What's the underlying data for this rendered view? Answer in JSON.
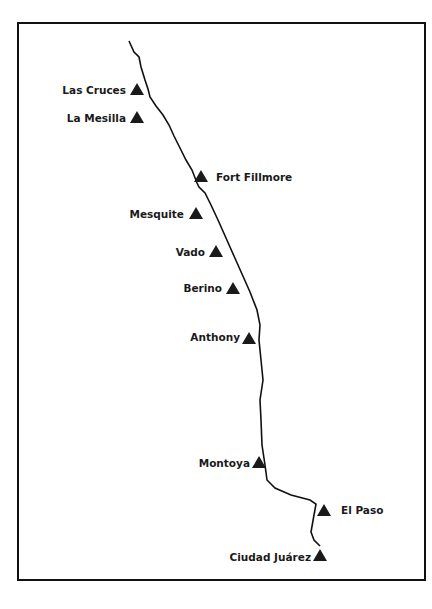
{
  "map": {
    "title": "",
    "river": {
      "name": "Rio Grande",
      "color": "#111111"
    },
    "marker_color": "#1a1a1a",
    "places": [
      {
        "name": "Las Cruces",
        "side": "left"
      },
      {
        "name": "La Mesilla",
        "side": "left"
      },
      {
        "name": "Fort Fillmore",
        "side": "right"
      },
      {
        "name": "Mesquite",
        "side": "left"
      },
      {
        "name": "Vado",
        "side": "left"
      },
      {
        "name": "Berino",
        "side": "left"
      },
      {
        "name": "Anthony",
        "side": "left"
      },
      {
        "name": "Montoya",
        "side": "left"
      },
      {
        "name": "El Paso",
        "side": "right"
      },
      {
        "name": "Ciudad Juárez",
        "side": "left"
      }
    ]
  }
}
